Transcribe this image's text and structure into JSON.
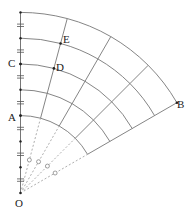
{
  "diagram": {
    "origin_label": "O",
    "points": [
      {
        "label": "A",
        "radius_units": 3,
        "angle_deg": 0
      },
      {
        "label": "C",
        "radius_units": 5,
        "angle_deg": 0
      },
      {
        "label": "D",
        "radius_units": 5,
        "angle_deg": 15
      },
      {
        "label": "E",
        "radius_units": 6,
        "angle_deg": 15
      },
      {
        "label": "B",
        "radius_units": 7,
        "angle_deg": 60
      }
    ],
    "arc_radii_units": [
      3,
      4,
      5,
      6,
      7
    ],
    "radial_angles_deg": [
      0,
      15,
      30,
      45,
      60
    ],
    "sector_angle_deg": 60,
    "colors": {
      "line": "#555555",
      "text": "#222222",
      "dashed": "#888888"
    }
  }
}
